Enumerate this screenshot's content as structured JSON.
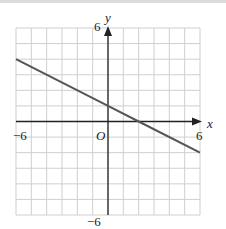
{
  "chart_data": {
    "type": "line",
    "title": "",
    "xlabel": "x",
    "ylabel": "y",
    "xlim": [
      -6,
      6
    ],
    "ylim": [
      -6,
      6
    ],
    "grid": true,
    "grid_step": 1,
    "origin_label": "O",
    "tick_labels": {
      "x_min": "−6",
      "x_max": "6",
      "y_min": "−6",
      "y_max": "6"
    },
    "series": [
      {
        "name": "line",
        "equation": "y = -0.5x + 1",
        "x": [
          -6,
          0,
          2,
          6
        ],
        "y": [
          4,
          1,
          0,
          -2
        ],
        "color": "#555555"
      }
    ],
    "colors": {
      "grid": "#cfcfcf",
      "axis": "#222222",
      "line": "#555555"
    }
  }
}
